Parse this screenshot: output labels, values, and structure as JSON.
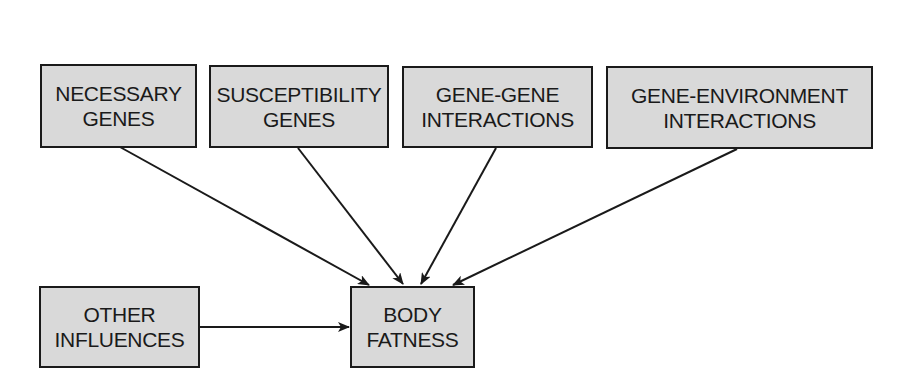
{
  "diagram": {
    "nodes": [
      {
        "id": "necessary_genes",
        "lines": [
          "NECESSARY",
          "GENES"
        ],
        "x": 40,
        "y": 64,
        "w": 157,
        "h": 84
      },
      {
        "id": "susceptibility_genes",
        "lines": [
          "SUSCEPTIBILITY",
          "GENES"
        ],
        "x": 209,
        "y": 65,
        "w": 180,
        "h": 83
      },
      {
        "id": "gene_gene",
        "lines": [
          "GENE-GENE",
          "INTERACTIONS"
        ],
        "x": 402,
        "y": 66,
        "w": 191,
        "h": 82
      },
      {
        "id": "gene_environment",
        "lines": [
          "GENE-ENVIRONMENT",
          "INTERACTIONS"
        ],
        "x": 606,
        "y": 66,
        "w": 267,
        "h": 83
      },
      {
        "id": "other_influences",
        "lines": [
          "OTHER",
          "INFLUENCES"
        ],
        "x": 39,
        "y": 286,
        "w": 161,
        "h": 82
      },
      {
        "id": "body_fatness",
        "lines": [
          "BODY",
          "FATNESS"
        ],
        "x": 350,
        "y": 286,
        "w": 125,
        "h": 82
      }
    ],
    "edges": [
      {
        "from": "necessary_genes",
        "to": "body_fatness"
      },
      {
        "from": "susceptibility_genes",
        "to": "body_fatness"
      },
      {
        "from": "gene_gene",
        "to": "body_fatness"
      },
      {
        "from": "gene_environment",
        "to": "body_fatness"
      },
      {
        "from": "other_influences",
        "to": "body_fatness"
      }
    ],
    "colors": {
      "box_fill": "#d9d9d9",
      "stroke": "#1a1a1a"
    }
  }
}
